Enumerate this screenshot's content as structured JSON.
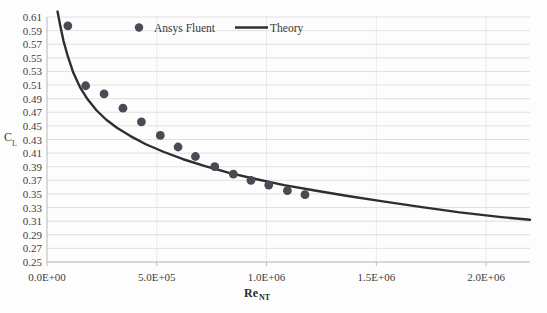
{
  "chart_data": {
    "type": "scatter",
    "title": "",
    "xlabel": "Re",
    "xlabel_sub": "NT",
    "ylabel": "C",
    "ylabel_sub": "L",
    "xlim": [
      0,
      2200000
    ],
    "ylim": [
      0.25,
      0.61
    ],
    "grid": true,
    "legend_position": "top-center-inside",
    "xticks": [
      0,
      500000,
      1000000,
      1500000,
      2000000
    ],
    "xtick_labels": [
      "0.0E+00",
      "5.0E+05",
      "1.0E+06",
      "1.5E+06",
      "2.0E+06"
    ],
    "yticks": [
      0.25,
      0.27,
      0.29,
      0.31,
      0.33,
      0.35,
      0.37,
      0.39,
      0.41,
      0.43,
      0.45,
      0.47,
      0.49,
      0.51,
      0.53,
      0.55,
      0.57,
      0.59,
      0.61
    ],
    "ytick_labels": [
      "0.25",
      "0.27",
      "0.29",
      "0.31",
      "0.33",
      "0.35",
      "0.37",
      "0.39",
      "0.41",
      "0.43",
      "0.45",
      "0.47",
      "0.49",
      "0.51",
      "0.53",
      "0.55",
      "0.57",
      "0.59",
      "0.61"
    ],
    "series": [
      {
        "name": "Ansys Fluent",
        "type": "scatter",
        "marker": "circle",
        "color": "#4a4a55",
        "points": [
          {
            "x": 95000,
            "y": 0.597
          },
          {
            "x": 176000,
            "y": 0.509
          },
          {
            "x": 260000,
            "y": 0.497
          },
          {
            "x": 346000,
            "y": 0.476
          },
          {
            "x": 430000,
            "y": 0.456
          },
          {
            "x": 516000,
            "y": 0.436
          },
          {
            "x": 597000,
            "y": 0.419
          },
          {
            "x": 676000,
            "y": 0.405
          },
          {
            "x": 764000,
            "y": 0.39
          },
          {
            "x": 849000,
            "y": 0.379
          },
          {
            "x": 929000,
            "y": 0.37
          },
          {
            "x": 1010000,
            "y": 0.363
          },
          {
            "x": 1095000,
            "y": 0.355
          },
          {
            "x": 1175000,
            "y": 0.349
          }
        ]
      },
      {
        "name": "Theory",
        "type": "line",
        "color": "#2e2e2e",
        "points": [
          {
            "x": 48000,
            "y": 0.618
          },
          {
            "x": 60000,
            "y": 0.598
          },
          {
            "x": 75000,
            "y": 0.575
          },
          {
            "x": 95000,
            "y": 0.552
          },
          {
            "x": 120000,
            "y": 0.528
          },
          {
            "x": 150000,
            "y": 0.507
          },
          {
            "x": 185000,
            "y": 0.489
          },
          {
            "x": 225000,
            "y": 0.473
          },
          {
            "x": 270000,
            "y": 0.459
          },
          {
            "x": 320000,
            "y": 0.447
          },
          {
            "x": 380000,
            "y": 0.435
          },
          {
            "x": 450000,
            "y": 0.423
          },
          {
            "x": 530000,
            "y": 0.412
          },
          {
            "x": 620000,
            "y": 0.401
          },
          {
            "x": 720000,
            "y": 0.391
          },
          {
            "x": 830000,
            "y": 0.381
          },
          {
            "x": 950000,
            "y": 0.372
          },
          {
            "x": 1080000,
            "y": 0.363
          },
          {
            "x": 1220000,
            "y": 0.355
          },
          {
            "x": 1370000,
            "y": 0.347
          },
          {
            "x": 1530000,
            "y": 0.339
          },
          {
            "x": 1700000,
            "y": 0.331
          },
          {
            "x": 1880000,
            "y": 0.323
          },
          {
            "x": 2070000,
            "y": 0.316
          },
          {
            "x": 2200000,
            "y": 0.312
          }
        ]
      }
    ],
    "legend": [
      {
        "label": "Ansys Fluent",
        "marker": "circle",
        "color": "#4a4a55"
      },
      {
        "label": "Theory",
        "marker": "line",
        "color": "#2e2e2e"
      }
    ],
    "colors": {
      "gridline": "#dcdcdc",
      "vertical_gridline": "#e8e8e8",
      "axis": "#bfbfbf",
      "background": "#fdfdfd",
      "marker": "#4a4a55",
      "line": "#2e2e2e",
      "text": "#3a3a3a"
    }
  }
}
